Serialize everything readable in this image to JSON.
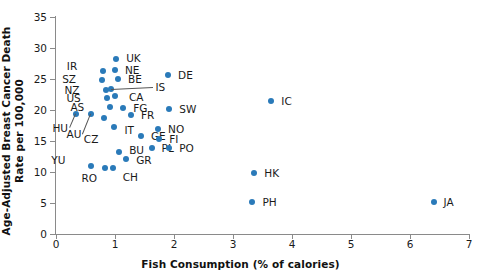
{
  "chart_data": {
    "type": "scatter",
    "title": "",
    "xlabel": "Fish Consumption (% of calories)",
    "ylabel": "Age-Adjusted Breast Cancer Death Rate per 100,000",
    "xlim": [
      0,
      7
    ],
    "ylim": [
      0,
      35
    ],
    "xticks": [
      "0",
      "1",
      "2",
      "3",
      "4",
      "5",
      "6",
      "7"
    ],
    "yticks": [
      "0",
      "5",
      "10",
      "15",
      "20",
      "25",
      "30",
      "35"
    ],
    "grid": false,
    "legend": "none",
    "marker_color": "#2a7ab9",
    "axis_color": "#8a8a8a",
    "text_color": "#1a1a1a",
    "points": [
      {
        "label": "UK",
        "x": 1.02,
        "y": 28.3,
        "lx": 6,
        "ly": -1,
        "side": "right"
      },
      {
        "label": "IR",
        "x": 0.8,
        "y": 26.3,
        "lx": -22,
        "ly": -5,
        "side": "left"
      },
      {
        "label": "NE",
        "x": 1.0,
        "y": 26.4,
        "lx": 6,
        "ly": 0,
        "side": "right"
      },
      {
        "label": "BE",
        "x": 1.05,
        "y": 25.0,
        "lx": 6,
        "ly": 0,
        "side": "right"
      },
      {
        "label": "SZ",
        "x": 0.78,
        "y": 24.9,
        "lx": -22,
        "ly": -1,
        "side": "left"
      },
      {
        "label": "NZ",
        "x": 0.84,
        "y": 23.3,
        "lx": -22,
        "ly": 0,
        "side": "left"
      },
      {
        "label": "IS",
        "x": 0.94,
        "y": 23.4,
        "lx": 40,
        "ly": -2,
        "side": "right",
        "leader": true
      },
      {
        "label": "CA",
        "x": 1.0,
        "y": 22.2,
        "lx": 10,
        "ly": 1,
        "side": "right"
      },
      {
        "label": "US",
        "x": 0.86,
        "y": 21.9,
        "lx": -22,
        "ly": 0,
        "side": "left"
      },
      {
        "label": "AS",
        "x": 0.92,
        "y": 20.5,
        "lx": -22,
        "ly": 0,
        "side": "left"
      },
      {
        "label": "FG",
        "x": 1.14,
        "y": 20.3,
        "lx": 6,
        "ly": 0,
        "side": "right"
      },
      {
        "label": "DE",
        "x": 1.9,
        "y": 25.6,
        "lx": 6,
        "ly": 0,
        "side": "right"
      },
      {
        "label": "SW",
        "x": 1.92,
        "y": 20.2,
        "lx": 6,
        "ly": 0,
        "side": "right"
      },
      {
        "label": "FR",
        "x": 1.27,
        "y": 19.2,
        "lx": 6,
        "ly": 0,
        "side": "right"
      },
      {
        "label": "HU",
        "x": 0.34,
        "y": 19.4,
        "lx": -4,
        "ly": 14,
        "side": "left",
        "leader": true
      },
      {
        "label": "AU",
        "x": 0.6,
        "y": 19.3,
        "lx": -6,
        "ly": 20,
        "side": "left",
        "leader": true
      },
      {
        "label": "CZ",
        "x": 0.82,
        "y": 18.7,
        "lx": -2,
        "ly": 21,
        "side": "left",
        "leader": false
      },
      {
        "label": "IT",
        "x": 0.99,
        "y": 17.3,
        "lx": 6,
        "ly": 3,
        "side": "right"
      },
      {
        "label": "GE",
        "x": 1.44,
        "y": 15.8,
        "lx": 6,
        "ly": 0,
        "side": "right"
      },
      {
        "label": "NO",
        "x": 1.73,
        "y": 16.9,
        "lx": 6,
        "ly": 0,
        "side": "right"
      },
      {
        "label": "FI",
        "x": 1.75,
        "y": 15.3,
        "lx": 6,
        "ly": 0,
        "side": "right"
      },
      {
        "label": "PL",
        "x": 1.62,
        "y": 13.9,
        "lx": 6,
        "ly": 0,
        "side": "right"
      },
      {
        "label": "PO",
        "x": 1.92,
        "y": 13.8,
        "lx": 6,
        "ly": 0,
        "side": "right"
      },
      {
        "label": "BU",
        "x": 1.07,
        "y": 13.2,
        "lx": 6,
        "ly": -2,
        "side": "right"
      },
      {
        "label": "GR",
        "x": 1.19,
        "y": 12.1,
        "lx": 6,
        "ly": 1,
        "side": "right"
      },
      {
        "label": "YU",
        "x": 0.6,
        "y": 11.0,
        "lx": -22,
        "ly": -6,
        "side": "left"
      },
      {
        "label": "RO",
        "x": 0.83,
        "y": 10.6,
        "lx": -4,
        "ly": 10,
        "side": "left"
      },
      {
        "label": "CH",
        "x": 0.96,
        "y": 10.7,
        "lx": 6,
        "ly": 9,
        "side": "right"
      },
      {
        "label": "IC",
        "x": 3.65,
        "y": 21.5,
        "lx": 6,
        "ly": 0,
        "side": "right"
      },
      {
        "label": "HK",
        "x": 3.36,
        "y": 9.9,
        "lx": 6,
        "ly": 0,
        "side": "right"
      },
      {
        "label": "PH",
        "x": 3.33,
        "y": 5.1,
        "lx": 6,
        "ly": 0,
        "side": "right"
      },
      {
        "label": "JA",
        "x": 6.4,
        "y": 5.1,
        "lx": 6,
        "ly": 0,
        "side": "right"
      }
    ]
  }
}
